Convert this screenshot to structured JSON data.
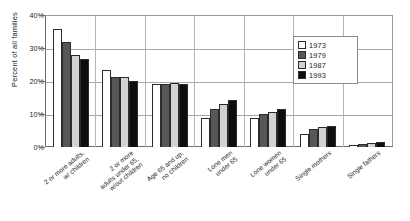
{
  "chart_data": {
    "type": "bar",
    "title": "",
    "subtitle": "",
    "xlabel": "",
    "ylabel": "Percent of all families",
    "ylim": [
      0,
      40
    ],
    "ytick_values": [
      0,
      10,
      20,
      30,
      40
    ],
    "ytick_labels": [
      "0%",
      "10%",
      "20%",
      "30%",
      "40%"
    ],
    "grid": true,
    "legend_position": "top-right",
    "categories": [
      "2 or more adults, w/ children",
      "2 or more adults under 65, w/out children",
      "Age 65 and up, no children",
      "Lone men under 65",
      "Lone women under 65",
      "Single mothers",
      "Single fathers"
    ],
    "category_lines": [
      [
        "2 or more adults,",
        "w/ children"
      ],
      [
        "2 or more",
        "adults under 65,",
        "w/out children"
      ],
      [
        "Age 65 and up,",
        "no children"
      ],
      [
        "Lone men",
        "under 65"
      ],
      [
        "Lone women",
        "under 65"
      ],
      [
        "Single mothers"
      ],
      [
        "Single fathers"
      ]
    ],
    "series": [
      {
        "name": "1973",
        "color": "#ffffff",
        "values": [
          36.0,
          23.5,
          19.2,
          9.0,
          8.8,
          4.0,
          0.7
        ]
      },
      {
        "name": "1979",
        "color": "#575757",
        "values": [
          32.0,
          21.5,
          19.3,
          11.5,
          10.2,
          5.5,
          1.0
        ]
      },
      {
        "name": "1987",
        "color": "#d2d2d2",
        "values": [
          28.0,
          21.4,
          19.4,
          13.0,
          10.6,
          6.0,
          1.2
        ]
      },
      {
        "name": "1993",
        "color": "#0d0d0d",
        "values": [
          27.0,
          20.1,
          19.2,
          14.5,
          11.6,
          6.3,
          1.5
        ]
      }
    ]
  },
  "legend": {
    "items": [
      {
        "label": "1973"
      },
      {
        "label": "1979"
      },
      {
        "label": "1987"
      },
      {
        "label": "1993"
      }
    ]
  }
}
